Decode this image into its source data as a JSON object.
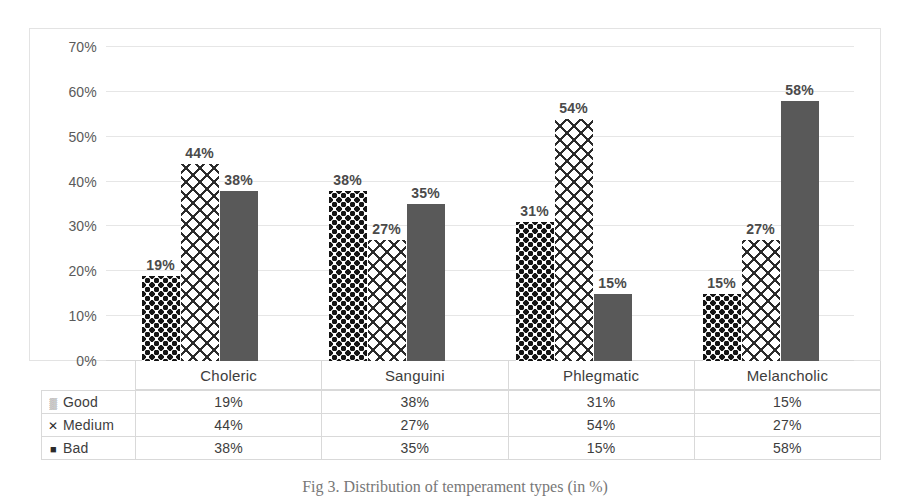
{
  "chart_data": {
    "type": "bar",
    "title": "",
    "xlabel": "",
    "ylabel": "",
    "ylim": [
      0,
      70
    ],
    "ytick_labels": [
      "0%",
      "10%",
      "20%",
      "30%",
      "40%",
      "50%",
      "60%",
      "70%"
    ],
    "ytick_values": [
      0,
      10,
      20,
      30,
      40,
      50,
      60,
      70
    ],
    "grid": true,
    "legend_position": "table-below",
    "categories": [
      "Choleric",
      "Sanguini",
      "Phlegmatic",
      "Melancholic"
    ],
    "series": [
      {
        "name": "Good",
        "marker": "dotted-square",
        "pattern": "dot-diamond",
        "values": [
          19,
          38,
          31,
          15
        ],
        "labels": [
          "19%",
          "38%",
          "31%",
          "15%"
        ]
      },
      {
        "name": "Medium",
        "marker": "x-cross",
        "pattern": "cross-hatch",
        "values": [
          44,
          27,
          54,
          27
        ],
        "labels": [
          "44%",
          "27%",
          "54%",
          "27%"
        ]
      },
      {
        "name": "Bad",
        "marker": "solid-square",
        "pattern": "solid",
        "values": [
          38,
          35,
          15,
          58
        ],
        "labels": [
          "38%",
          "35%",
          "15%",
          "58%"
        ]
      }
    ]
  },
  "legend_markers": {
    "good": "▒",
    "medium": "✕",
    "bad": "■"
  },
  "colors": {
    "bar_solid": "#595959",
    "pattern_ink": "#141414",
    "gridline": "#e6e6e6",
    "frame_border": "#e3e3e3",
    "table_border": "#d9d9d9",
    "text": "#3d3d3d"
  },
  "caption": {
    "text": "Fig 3.  Distribution of temperament types (in %)"
  }
}
